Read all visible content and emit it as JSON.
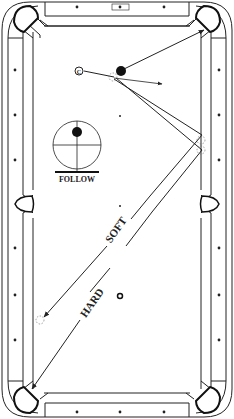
{
  "diagram": {
    "type": "pool-table-shot-diagram",
    "colors": {
      "line": "#222222",
      "background": "#ffffff",
      "ball": "#111111"
    },
    "labels": {
      "follow": "FOLLOW",
      "soft": "SOFT",
      "hard": "HARD",
      "cue_ball": "C"
    },
    "english_diagram": {
      "name": "cue-tip-position",
      "spin": "follow"
    },
    "balls": {
      "cue_ball": {
        "x": 79,
        "y": 71
      },
      "object_ball": {
        "x": 120,
        "y": 72
      }
    },
    "paths": [
      {
        "name": "object-ball-to-corner-pocket",
        "from": [
          122,
          69
        ],
        "to": [
          205,
          30
        ]
      },
      {
        "name": "cue-ball-tangent-line",
        "from": [
          115,
          79
        ],
        "to": [
          162,
          84
        ]
      },
      {
        "name": "soft-shot-path",
        "via": [
          [
            115,
            79
          ],
          [
            203,
            135
          ],
          [
            147,
            200
          ]
        ],
        "end": [
          43,
          318
        ],
        "speed": "SOFT"
      },
      {
        "name": "hard-shot-path",
        "via": [
          [
            115,
            79
          ],
          [
            203,
            150
          ],
          [
            155,
            215
          ]
        ],
        "end": [
          30,
          410
        ],
        "speed": "HARD"
      }
    ],
    "spots": [
      {
        "name": "head-spot",
        "x": 120,
        "y": 116
      },
      {
        "name": "center-spot",
        "x": 120,
        "y": 206
      },
      {
        "name": "foot-spot",
        "x": 120,
        "y": 296
      }
    ],
    "diamonds": {
      "top": [
        [
          77,
          7
        ],
        [
          120,
          7
        ],
        [
          164,
          7
        ]
      ],
      "bottom": [
        [
          77,
          412
        ],
        [
          120,
          412
        ],
        [
          164,
          412
        ]
      ],
      "left": [
        [
          15,
          70
        ],
        [
          15,
          115
        ],
        [
          15,
          160
        ],
        [
          15,
          248
        ],
        [
          15,
          295
        ],
        [
          15,
          340
        ]
      ],
      "right": [
        [
          224,
          70
        ],
        [
          224,
          115
        ],
        [
          224,
          160
        ],
        [
          224,
          248
        ],
        [
          224,
          295
        ],
        [
          224,
          340
        ]
      ]
    }
  }
}
